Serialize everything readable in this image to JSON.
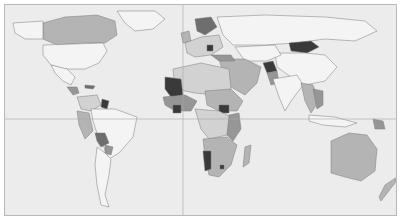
{
  "map": {
    "type": "choropleth",
    "projection": "equirectangular-like",
    "background_color": "#ececec",
    "border_color": "#7a7a7a",
    "palette": {
      "none": "#f4f4f4",
      "light": "#d2d2d2",
      "medium_light": "#b4b4b4",
      "medium": "#969696",
      "medium_dark": "#6e6e6e",
      "dark": "#3a3a3a"
    },
    "gridlines": {
      "equator_y": 114,
      "meridian_x": 178
    },
    "regions": [
      {
        "name": "Canada",
        "shade": "medium_light",
        "d": "M38,18 L60,12 L92,10 L110,16 L112,30 L100,38 L78,38 L52,40 L38,34 Z"
      },
      {
        "name": "Alaska",
        "shade": "none",
        "d": "M8,18 L38,16 L38,34 L20,34 L10,28 Z"
      },
      {
        "name": "Greenland",
        "shade": "none",
        "d": "M112,6 L150,6 L160,14 L148,24 L130,26 L120,18 Z"
      },
      {
        "name": "United States",
        "shade": "none",
        "d": "M38,40 L98,38 L102,46 L94,58 L80,64 L60,64 L46,60 L38,50 Z"
      },
      {
        "name": "Mexico",
        "shade": "none",
        "d": "M46,60 L62,64 L70,72 L66,80 L58,76 L50,68 Z"
      },
      {
        "name": "Central America",
        "shade": "medium",
        "d": "M62,82 L72,82 L74,88 L68,90 Z"
      },
      {
        "name": "Cuba/Caribbean",
        "shade": "medium_dark",
        "d": "M80,80 L90,81 L88,84 L80,83 Z"
      },
      {
        "name": "Colombia/Venezuela",
        "shade": "light",
        "d": "M72,92 L92,90 L96,100 L86,106 L76,104 Z"
      },
      {
        "name": "Guyana",
        "shade": "dark",
        "d": "M97,94 L104,96 L102,104 L96,102 Z"
      },
      {
        "name": "Peru/Ecuador",
        "shade": "medium_light",
        "d": "M72,106 L84,108 L88,126 L80,134 L74,120 Z"
      },
      {
        "name": "Brazil",
        "shade": "none",
        "d": "M86,104 L110,104 L132,112 L128,132 L114,148 L104,154 L98,140 L92,128 L88,116 Z"
      },
      {
        "name": "Bolivia",
        "shade": "medium_dark",
        "d": "M90,128 L100,128 L104,138 L96,142 L92,136 Z"
      },
      {
        "name": "Paraguay",
        "shade": "medium",
        "d": "M100,140 L108,142 L106,150 L100,148 Z"
      },
      {
        "name": "Argentina/Chile",
        "shade": "none",
        "d": "M92,142 L100,148 L106,154 L104,170 L100,190 L104,202 L96,200 L92,180 L90,160 Z"
      },
      {
        "name": "UK/Western Europe",
        "shade": "medium_light",
        "d": "M176,28 L184,26 L186,36 L178,38 Z"
      },
      {
        "name": "Scandinavia",
        "shade": "medium_dark",
        "d": "M190,14 L206,12 L212,22 L200,30 L192,26 Z"
      },
      {
        "name": "Europe",
        "shade": "light",
        "d": "M180,38 L196,32 L214,30 L218,42 L206,50 L190,52 L182,48 Z"
      },
      {
        "name": "Balkans",
        "shade": "dark",
        "d": "M202,40 L208,40 L208,46 L202,46 Z"
      },
      {
        "name": "Russia",
        "shade": "none",
        "d": "M212,12 L260,10 L320,12 L360,16 L372,26 L350,36 L320,34 L290,38 L260,40 L228,40 L218,30 Z"
      },
      {
        "name": "Mongolia",
        "shade": "dark",
        "d": "M284,38 L306,36 L314,42 L302,48 L286,46 Z"
      },
      {
        "name": "China",
        "shade": "none",
        "d": "M270,48 L300,48 L320,50 L332,62 L320,76 L300,80 L286,72 L272,62 Z"
      },
      {
        "name": "Kazakhstan/Central Asia",
        "shade": "none",
        "d": "M230,42 L270,40 L276,50 L262,56 L240,56 Z"
      },
      {
        "name": "Afghanistan",
        "shade": "dark",
        "d": "M258,58 L268,56 L272,66 L262,68 Z"
      },
      {
        "name": "Pakistan",
        "shade": "medium",
        "d": "M262,68 L272,66 L274,78 L266,80 Z"
      },
      {
        "name": "Middle East",
        "shade": "medium_light",
        "d": "M214,54 L240,54 L256,62 L252,78 L240,90 L226,82 L218,68 Z"
      },
      {
        "name": "Turkey/Caucasus",
        "shade": "medium",
        "d": "M206,50 L226,50 L230,56 L214,56 Z"
      },
      {
        "name": "India",
        "shade": "none",
        "d": "M268,74 L292,70 L298,80 L286,96 L280,106 L274,92 Z"
      },
      {
        "name": "Myanmar/SE Asia",
        "shade": "medium_light",
        "d": "M296,78 L308,80 L314,96 L306,108 L300,96 Z"
      },
      {
        "name": "Indochina",
        "shade": "medium",
        "d": "M308,84 L318,86 L318,100 L312,104 Z"
      },
      {
        "name": "Indonesia",
        "shade": "none",
        "d": "M304,110 L330,112 L352,118 L340,122 L318,120 L304,116 Z"
      },
      {
        "name": "Papua New Guinea",
        "shade": "medium",
        "d": "M368,114 L378,116 L380,124 L370,124 Z"
      },
      {
        "name": "Australia",
        "shade": "medium_light",
        "d": "M326,136 L344,128 L362,130 L372,144 L370,166 L356,176 L340,172 L326,168 L326,150 Z"
      },
      {
        "name": "New Zealand",
        "shade": "medium_light",
        "d": "M380,180 L392,172 L390,178 L376,196 L374,192 Z"
      },
      {
        "name": "North Africa",
        "shade": "light",
        "d": "M168,64 L196,58 L224,64 L226,84 L210,90 L190,88 L170,84 Z"
      },
      {
        "name": "Mauritania/Mali",
        "shade": "dark",
        "d": "M160,72 L176,74 L178,90 L166,92 L160,84 Z"
      },
      {
        "name": "West Africa",
        "shade": "medium",
        "d": "M158,92 L180,90 L192,96 L186,106 L170,106 L160,100 Z"
      },
      {
        "name": "Sierra Leone/Liberia",
        "shade": "dark",
        "d": "M168,100 L176,100 L176,108 L168,108 Z"
      },
      {
        "name": "Sudan/Horn",
        "shade": "medium_light",
        "d": "M200,86 L226,84 L238,96 L232,106 L214,106 L202,100 Z"
      },
      {
        "name": "South Sudan",
        "shade": "dark",
        "d": "M214,100 L224,100 L224,108 L214,108 Z"
      },
      {
        "name": "Central Africa",
        "shade": "light",
        "d": "M190,104 L214,106 L226,112 L222,130 L204,134 L196,124 Z"
      },
      {
        "name": "East Africa",
        "shade": "medium",
        "d": "M224,110 L234,108 L236,124 L228,136 L222,130 Z"
      },
      {
        "name": "Southern Africa",
        "shade": "medium_light",
        "d": "M198,134 L222,132 L232,140 L226,160 L214,172 L204,170 L200,152 Z"
      },
      {
        "name": "Namibia",
        "shade": "dark",
        "d": "M198,146 L206,146 L206,164 L200,166 Z"
      },
      {
        "name": "Lesotho",
        "shade": "dark",
        "d": "M215,160 L219,160 L219,164 L215,164 Z"
      },
      {
        "name": "Madagascar",
        "shade": "medium_light",
        "d": "M240,142 L246,140 L244,158 L238,162 Z"
      }
    ]
  }
}
